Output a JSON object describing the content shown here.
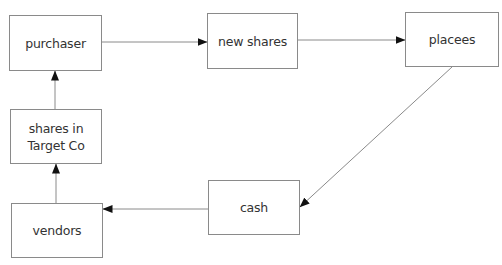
{
  "diagram": {
    "type": "flow",
    "nodes": [
      {
        "id": "purchaser",
        "label": "purchaser",
        "box": {
          "x": 9,
          "y": 15,
          "w": 93,
          "h": 56
        }
      },
      {
        "id": "new_shares",
        "label": "new shares",
        "box": {
          "x": 207,
          "y": 13,
          "w": 91,
          "h": 56
        }
      },
      {
        "id": "placees",
        "label": "placees",
        "box": {
          "x": 405,
          "y": 12,
          "w": 94,
          "h": 55
        }
      },
      {
        "id": "shares_in_target_co",
        "label": "shares in\nTarget Co",
        "box": {
          "x": 10,
          "y": 109,
          "w": 92,
          "h": 55
        }
      },
      {
        "id": "vendors",
        "label": "vendors",
        "box": {
          "x": 11,
          "y": 203,
          "w": 92,
          "h": 55
        }
      },
      {
        "id": "cash",
        "label": "cash",
        "box": {
          "x": 208,
          "y": 180,
          "w": 92,
          "h": 55
        }
      }
    ],
    "edges": [
      {
        "from": "purchaser",
        "to": "new_shares",
        "x1": 102,
        "y1": 42,
        "x2": 207,
        "y2": 42
      },
      {
        "from": "new_shares",
        "to": "placees",
        "x1": 298,
        "y1": 40,
        "x2": 405,
        "y2": 40
      },
      {
        "from": "placees",
        "to": "cash",
        "x1": 452,
        "y1": 67,
        "x2": 300,
        "y2": 207
      },
      {
        "from": "cash",
        "to": "vendors",
        "x1": 208,
        "y1": 209,
        "x2": 103,
        "y2": 209
      },
      {
        "from": "vendors",
        "to": "shares_in_target_co",
        "x1": 56,
        "y1": 203,
        "x2": 56,
        "y2": 164
      },
      {
        "from": "shares_in_target_co",
        "to": "purchaser",
        "x1": 55,
        "y1": 109,
        "x2": 55,
        "y2": 71
      }
    ],
    "colors": {
      "box_border": "#8a8a8a",
      "text": "#333333",
      "edge": "#8a8a8a",
      "arrowhead": "#111111"
    }
  }
}
